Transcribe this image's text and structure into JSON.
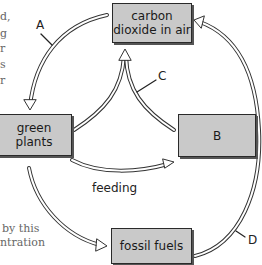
{
  "diagram": {
    "type": "carbon-cycle",
    "nodes": {
      "co2": "carbon dioxide in air",
      "co2_line1": "carbon",
      "co2_line2": "dioxide in air",
      "plants_line1": "green",
      "plants_line2": "plants",
      "b": "B",
      "fossil": "fossil fuels"
    },
    "edges": {
      "a": "A",
      "c": "C",
      "d": "D",
      "feeding": "feeding"
    },
    "edge_list": [
      {
        "from": "carbon dioxide in air",
        "to": "green plants",
        "label": "A"
      },
      {
        "from": "green plants",
        "to": "carbon dioxide in air",
        "label": "C"
      },
      {
        "from": "B",
        "to": "carbon dioxide in air",
        "label": "C"
      },
      {
        "from": "green plants",
        "to": "B",
        "label": "feeding"
      },
      {
        "from": "green plants",
        "to": "fossil fuels",
        "label": ""
      },
      {
        "from": "fossil fuels",
        "to": "carbon dioxide in air",
        "label": "D"
      }
    ]
  },
  "clipped_text": {
    "left_fragments": [
      "d,",
      "g",
      "r",
      "s",
      "r"
    ],
    "bottom_line1": "by this",
    "bottom_line2": "ntration"
  },
  "colors": {
    "box_fill": "#c9c9c9",
    "box_border": "#2a2a2a",
    "arrow": "#333333"
  }
}
